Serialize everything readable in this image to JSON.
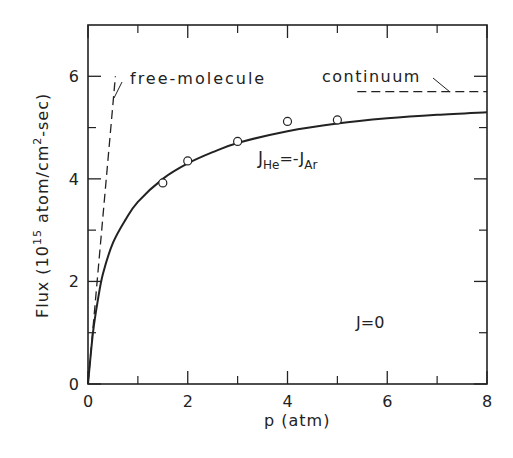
{
  "chart_data": {
    "type": "line",
    "title": "",
    "xlabel": "p (atm)",
    "ylabel": "Flux (10^15 atom/cm^2-sec)",
    "ylabel_parts": {
      "main": "Flux (10",
      "exp": "15",
      "mid": " atom/cm",
      "exp2": "2",
      "tail": "-sec)"
    },
    "xlim": [
      0,
      8
    ],
    "ylim": [
      0,
      7
    ],
    "x_ticks": [
      0,
      2,
      4,
      6,
      8
    ],
    "x_minor_ticks": [
      1,
      3,
      5,
      7
    ],
    "y_ticks": [
      0,
      2,
      4,
      6
    ],
    "y_minor_ticks": [
      1,
      3,
      5
    ],
    "grid": false,
    "series": [
      {
        "name": "J_He = -J_Ar (theory)",
        "style": "solid",
        "x": [
          0,
          0.1,
          0.2,
          0.3,
          0.5,
          0.75,
          1.0,
          1.5,
          2.0,
          2.5,
          3.0,
          4.0,
          5.0,
          6.0,
          7.0,
          8.0
        ],
        "y": [
          0,
          1.0,
          1.65,
          2.15,
          2.75,
          3.2,
          3.55,
          4.0,
          4.3,
          4.52,
          4.7,
          4.93,
          5.08,
          5.18,
          5.25,
          5.3
        ]
      },
      {
        "name": "free-molecule",
        "style": "dashed",
        "x": [
          0,
          0.55
        ],
        "y": [
          0,
          6.0
        ]
      },
      {
        "name": "continuum",
        "style": "dashed",
        "x": [
          5.4,
          8.0
        ],
        "y": [
          5.7,
          5.7
        ]
      },
      {
        "name": "experimental points",
        "style": "markers-open-circle",
        "x": [
          1.5,
          2.0,
          3.0,
          4.0,
          5.0
        ],
        "y": [
          3.92,
          4.35,
          4.73,
          5.12,
          5.15
        ]
      }
    ],
    "annotations": [
      {
        "text": "free-molecule",
        "x": 0.6,
        "y": 5.95
      },
      {
        "text": "continuum",
        "x": 5.4,
        "y": 5.95
      },
      {
        "text": "J_He = -J_Ar",
        "x": 3.4,
        "y": 4.25
      },
      {
        "text": "J=0",
        "x": 6.3,
        "y": 1.1
      }
    ]
  },
  "labels": {
    "free_molecule": "free-molecule",
    "continuum": "continuum",
    "j_main": "J",
    "j_he_sub": "He",
    "j_eq": "=-J",
    "j_ar_sub": "Ar",
    "j_zero": "J=0",
    "xlabel": "p (atm)",
    "ylabel_main": "Flux (10",
    "ylabel_exp": "15",
    "ylabel_mid": " atom/cm",
    "ylabel_exp2": "2",
    "ylabel_tail": "-sec)"
  },
  "colors": {
    "ink": "#222222",
    "background": "#ffffff"
  }
}
